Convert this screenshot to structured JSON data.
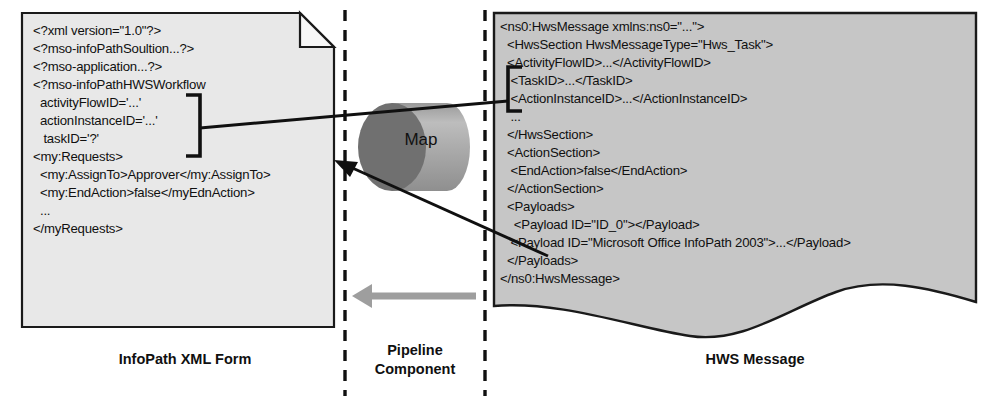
{
  "diagram": {
    "colors": {
      "document_fill": "#e8e8e8",
      "document_stroke": "#1a1a1a",
      "message_fill": "#c6c6c6",
      "cylinder_body": "#a8a8a8",
      "cylinder_cap": "#6e6e6e",
      "cylinder_highlight": "#bcbcbc",
      "gray_arrow": "#9a9a9a",
      "connector": "#101010",
      "text": "#101010"
    }
  },
  "left_document": {
    "name": "InfoPath XML Form",
    "lines": [
      "<?xml version=\"1.0\"?>",
      "<?mso-infoPathSoultion...?>",
      "<?mso-application...?>",
      "<?mso-infoPathHWSWorkflow",
      "  activityFlowID='...'",
      "  actionInstanceID='...'",
      "   taskID='?'",
      "<my:Requests>",
      "  <my:AssignTo>Approver</my:AssignTo>",
      "  <my:EndAction>false</myEdnAction>",
      "  ...",
      "</myRequests>"
    ]
  },
  "right_document": {
    "name": "HWS Message",
    "lines": [
      "<ns0:HwsMessage xmlns:ns0=\"...\">",
      "  <HwsSection HwsMessageType=\"Hws_Task\">",
      "  <ActivityFlowID>...</ActivityFlowID>",
      "   <TaskID>...</TaskID>",
      "   <ActionInstanceID>...</ActionInstanceID>",
      "   ...",
      "  </HwsSection>",
      "  <ActionSection>",
      "   <EndAction>false</EndAction>",
      "  </ActionSection>",
      "  <Payloads>",
      "    <Payload ID=\"ID_0\"></Payload>",
      "   <Payload ID=\"Microsoft Office InfoPath 2003\">...</Payload>",
      "  </Payloads>",
      "</ns0:HwsMessage>"
    ]
  },
  "pipeline": {
    "component_label_line1": "Pipeline",
    "component_label_line2": "Component",
    "map_label": "Map"
  },
  "captions": {
    "left": "InfoPath XML Form",
    "right": "HWS Message"
  }
}
